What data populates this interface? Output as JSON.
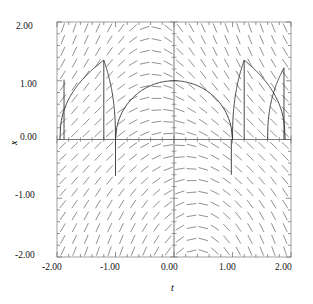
{
  "chart_data": {
    "type": "line",
    "title": "",
    "subtitle": "",
    "xlabel": "t",
    "ylabel": "x",
    "xlim": [
      -2.0,
      2.0
    ],
    "ylim": [
      -2.0,
      2.0
    ],
    "grid": false,
    "legend": null,
    "plot_kind": "direction-field-with-solution-curves",
    "xticks": [
      -2.0,
      -1.0,
      0.0,
      1.0,
      2.0
    ],
    "xticklabels": [
      "-2.00",
      "-1.00",
      "0.00",
      "1.00",
      "2.00"
    ],
    "yticks": [
      -2.0,
      -1.0,
      0.0,
      1.0,
      2.0
    ],
    "yticklabels": [
      "-2.00",
      "-1.00",
      "0.00",
      "1.00",
      "2.00"
    ],
    "minor_tick_count_per_interval": 5,
    "axis_lines": {
      "x_axis_at_y": 0.0,
      "y_axis_at_x": 0.0
    },
    "direction_field": {
      "description": "grid of short line segments showing slope dx/dt = -sin(t)*? radial pattern; segments tilt positively in lower-right and upper-left, negatively in upper-right and lower-left",
      "t_range": [
        -1.9,
        1.9
      ],
      "x_range": [
        -1.9,
        1.9
      ],
      "nt": 20,
      "nx": 20,
      "segment_length_px": 9,
      "color": "#555555"
    },
    "solution_curves": [
      {
        "name": "central-arc",
        "t_start": -1.0,
        "t_end": 1.0,
        "peak_x": 1.0,
        "peak_t": 0.0
      },
      {
        "name": "left-arc-1",
        "t_start": -1.95,
        "t_end": -1.2,
        "peak_x": 1.35,
        "peak_t": -1.2
      },
      {
        "name": "left-arc-2",
        "t_start": -1.2,
        "t_end": -1.0,
        "peak_x": 1.35,
        "peak_t": -1.2
      },
      {
        "name": "right-arc-1",
        "t_start": 1.0,
        "t_end": 1.2,
        "peak_x": 1.35,
        "peak_t": 1.2
      },
      {
        "name": "right-arc-2",
        "t_start": 1.2,
        "t_end": 1.9,
        "peak_x": 1.35,
        "peak_t": 1.2
      },
      {
        "name": "far-right-arc",
        "t_start": 1.85,
        "t_end": 2.0,
        "peak_x": 1.2,
        "peak_t": 1.85
      }
    ],
    "series": [
      {
        "name": "solution",
        "x": [
          -1.0,
          -0.75,
          -0.5,
          -0.25,
          0.0,
          0.25,
          0.5,
          0.75,
          1.0
        ],
        "values": [
          0.0,
          0.66,
          0.87,
          0.97,
          1.0,
          0.97,
          0.87,
          0.66,
          0.0
        ]
      }
    ],
    "colors": {
      "curve": "#333333",
      "field": "#555555",
      "axis": "#666666",
      "frame": "#888888"
    }
  },
  "axis_labels": {
    "x": "t",
    "y": "x"
  },
  "tick_text": {
    "y_top": "2.00",
    "y_upper": "1.00",
    "y_mid": "0.00",
    "y_lower": "-1.00",
    "y_bottom": "-2.00",
    "x_left": "-2.00",
    "x_left_mid": "-1.00",
    "x_mid": "0.00",
    "x_right_mid": "1.00",
    "x_right": "2.00"
  }
}
